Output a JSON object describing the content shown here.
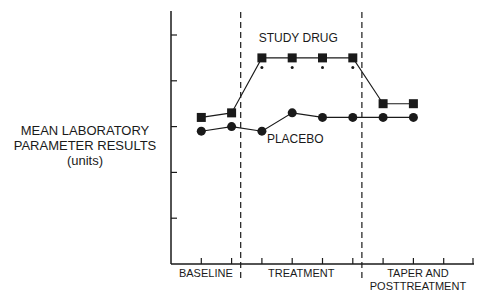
{
  "chart_data": {
    "type": "line",
    "title": "",
    "xlabel": "",
    "ylabel": "MEAN LABORATORY PARAMETER RESULTS (units)",
    "ylabel_lines": [
      "MEAN LABORATORY",
      "PARAMETER RESULTS",
      "(units)"
    ],
    "ytick_labels": [],
    "y_ticks": [
      1,
      2,
      3,
      4,
      5
    ],
    "ylim": [
      0,
      5.3
    ],
    "grid": false,
    "x": [
      1,
      2,
      3,
      4,
      5,
      6,
      7,
      8
    ],
    "x_ticks": [
      1,
      2,
      3,
      4,
      5,
      6,
      7,
      8,
      9,
      10
    ],
    "xlim": [
      0,
      10
    ],
    "phases": [
      {
        "label": "BASELINE",
        "lines": [
          "BASELINE"
        ],
        "start": 0,
        "end": 2.3
      },
      {
        "label": "TREATMENT",
        "lines": [
          "TREATMENT"
        ],
        "start": 2.3,
        "end": 6.3
      },
      {
        "label": "TAPER AND POSTTREATMENT",
        "lines": [
          "TAPER AND",
          "POSTTREATMENT"
        ],
        "start": 6.3,
        "end": 10
      }
    ],
    "phase_dividers": [
      2.3,
      6.3
    ],
    "series": [
      {
        "name": "STUDY DRUG",
        "marker": "square",
        "values": [
          3.2,
          3.3,
          4.5,
          4.5,
          4.5,
          4.5,
          3.5,
          3.5
        ],
        "significant": [
          false,
          false,
          true,
          true,
          true,
          true,
          false,
          false
        ]
      },
      {
        "name": "PLACEBO",
        "marker": "circle",
        "values": [
          2.9,
          3.0,
          2.9,
          3.3,
          3.2,
          3.2,
          3.2,
          3.2
        ],
        "significant": [
          false,
          false,
          false,
          false,
          false,
          false,
          false,
          false
        ]
      }
    ],
    "annotations": [
      {
        "text": "STUDY DRUG",
        "series": "STUDY DRUG",
        "x": 4.2,
        "y": 4.85
      },
      {
        "text": "PLACEBO",
        "series": "PLACEBO",
        "x": 4.1,
        "y": 2.65
      },
      {
        "text": "*",
        "meaning": "significant difference",
        "x_points": [
          3,
          4,
          5,
          6
        ]
      }
    ],
    "legend": "inline labels"
  },
  "colors": {
    "ink": "#1a1a1a",
    "background": "#ffffff"
  }
}
